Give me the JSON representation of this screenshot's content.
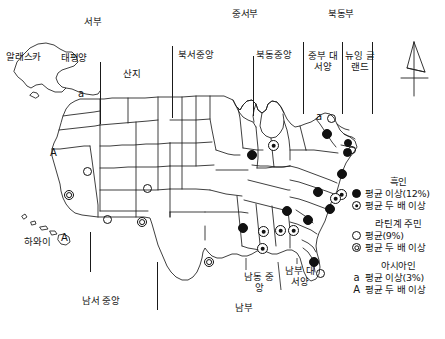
{
  "figure": {
    "title": "",
    "type": "choropleth-point-map",
    "region": "United States census divisions"
  },
  "region_labels": {
    "top_major": [
      {
        "text": "서부",
        "x": 92,
        "y": 21
      },
      {
        "text": "중서부",
        "x": 244,
        "y": 13
      },
      {
        "text": "북동부",
        "x": 341,
        "y": 13
      }
    ],
    "divisions": [
      {
        "text": "태평양",
        "x": 71,
        "y": 57
      },
      {
        "text": "산지",
        "x": 132,
        "y": 73
      },
      {
        "text": "북서중앙",
        "x": 196,
        "y": 54
      },
      {
        "text": "북동중앙",
        "x": 273,
        "y": 54
      },
      {
        "text": "중부\n대서양",
        "x": 314,
        "y": 55
      },
      {
        "text": "뉴잉\n글랜드",
        "x": 355,
        "y": 55
      },
      {
        "text": "남서 중앙",
        "x": 100,
        "y": 300
      },
      {
        "text": "남부",
        "x": 245,
        "y": 307
      },
      {
        "text": "남동\n중앙",
        "x": 258,
        "y": 278
      },
      {
        "text": "남부\n대서양",
        "x": 299,
        "y": 272
      }
    ],
    "places": [
      {
        "text": "알래스카",
        "x": 10,
        "y": 56
      },
      {
        "text": "하와이",
        "x": 27,
        "y": 241
      }
    ]
  },
  "dividers": [
    {
      "x": 100,
      "y": 62,
      "h": 62
    },
    {
      "x": 172,
      "y": 46,
      "h": 72
    },
    {
      "x": 253,
      "y": 56,
      "h": 60
    },
    {
      "x": 303,
      "y": 42,
      "h": 72
    },
    {
      "x": 342,
      "y": 42,
      "h": 72
    },
    {
      "x": 372,
      "y": 42,
      "h": 72
    },
    {
      "x": 90,
      "y": 232,
      "h": 40
    },
    {
      "x": 157,
      "y": 262,
      "h": 48
    }
  ],
  "legend": {
    "groups": [
      {
        "name": "black-group",
        "heading": "흑인",
        "entries": [
          {
            "symbol": "filled-circle",
            "label": "평균 이상(12%)"
          },
          {
            "symbol": "ring-filled-circle",
            "label": "평균 두 배 이상"
          }
        ]
      },
      {
        "name": "latino-group",
        "heading": "라틴계 주민",
        "entries": [
          {
            "symbol": "hollow-circle",
            "label": "평균(9%)"
          },
          {
            "symbol": "double-circle",
            "label": "평균 두 배 이상"
          }
        ]
      },
      {
        "name": "asian-group",
        "heading": "아시아인",
        "entries": [
          {
            "symbol": "letter-a-lower",
            "label": "평균 이상(3%)"
          },
          {
            "symbol": "letter-a-upper",
            "label": "평균 두 배 이상"
          }
        ]
      }
    ]
  },
  "map_markers": [
    {
      "name": "washington-asian",
      "type": "glyph",
      "glyph": "a",
      "x": 82,
      "y": 94
    },
    {
      "name": "california-asian",
      "type": "glyph",
      "glyph": "A",
      "x": 54,
      "y": 153
    },
    {
      "name": "hawaii-asian",
      "type": "glyph",
      "glyph": "A",
      "x": 65,
      "y": 238
    },
    {
      "name": "california-latino-double",
      "type": "double",
      "x": 69,
      "y": 195
    },
    {
      "name": "nevada-latino",
      "type": "hollow",
      "x": 88,
      "y": 172
    },
    {
      "name": "arizona-latino",
      "type": "hollow",
      "x": 108,
      "y": 220
    },
    {
      "name": "newmexico-latino-double",
      "type": "double",
      "x": 142,
      "y": 222
    },
    {
      "name": "colorado-latino",
      "type": "hollow",
      "x": 148,
      "y": 189
    },
    {
      "name": "texas-latino-double",
      "type": "double",
      "x": 209,
      "y": 262
    },
    {
      "name": "florida-latino",
      "type": "hollow",
      "x": 320,
      "y": 273
    },
    {
      "name": "newyork-asian",
      "type": "glyph",
      "glyph": "a",
      "x": 320,
      "y": 117
    },
    {
      "name": "newyork-latino",
      "type": "hollow",
      "x": 331,
      "y": 119
    },
    {
      "name": "newjersey-latino",
      "type": "hollow",
      "x": 352,
      "y": 150
    },
    {
      "name": "illinois-black",
      "type": "filled",
      "x": 252,
      "y": 155
    },
    {
      "name": "michigan-black-double",
      "type": "ring-filled",
      "x": 273,
      "y": 145
    },
    {
      "name": "pennsylvania-black",
      "type": "filled",
      "x": 327,
      "y": 134
    },
    {
      "name": "newyork-metro-black",
      "type": "filled",
      "x": 348,
      "y": 143
    },
    {
      "name": "newjersey-black",
      "type": "filled",
      "x": 347,
      "y": 152
    },
    {
      "name": "maryland-black",
      "type": "filled",
      "x": 342,
      "y": 174
    },
    {
      "name": "delaware-black-double",
      "type": "ring-filled",
      "x": 341,
      "y": 194
    },
    {
      "name": "virginia-black",
      "type": "filled",
      "x": 318,
      "y": 192
    },
    {
      "name": "dc-black-double",
      "type": "ring-filled",
      "x": 335,
      "y": 198
    },
    {
      "name": "northcarolina-black",
      "type": "filled",
      "x": 330,
      "y": 209
    },
    {
      "name": "tennessee-black",
      "type": "filled",
      "x": 287,
      "y": 211
    },
    {
      "name": "southcarolina-black",
      "type": "filled",
      "x": 308,
      "y": 220
    },
    {
      "name": "georgia-black-double",
      "type": "ring-filled",
      "x": 293,
      "y": 230
    },
    {
      "name": "arkansas-black",
      "type": "filled",
      "x": 243,
      "y": 228
    },
    {
      "name": "mississippi-black-double",
      "type": "ring-filled",
      "x": 263,
      "y": 231
    },
    {
      "name": "alabama-black-double",
      "type": "ring-filled",
      "x": 280,
      "y": 230
    },
    {
      "name": "louisiana-black-double",
      "type": "ring-filled",
      "x": 262,
      "y": 248
    },
    {
      "name": "florida-black",
      "type": "filled",
      "x": 314,
      "y": 262
    }
  ],
  "compass": {
    "name": "north-arrow",
    "x": 397,
    "y": 38
  }
}
